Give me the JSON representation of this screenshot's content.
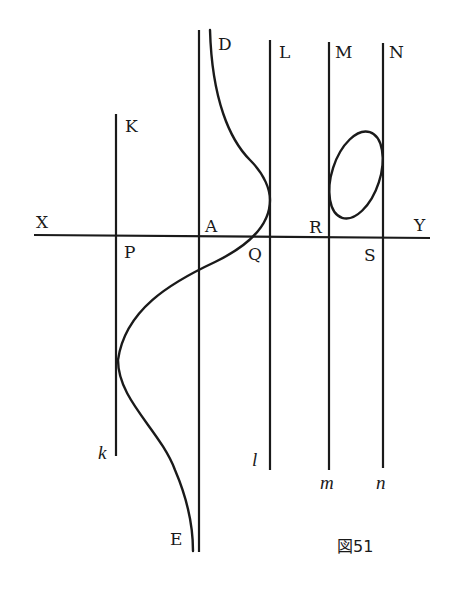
{
  "figure": {
    "caption": "図51",
    "labels": {
      "X": "X",
      "Y": "Y",
      "A": "A",
      "P": "P",
      "Q": "Q",
      "R": "R",
      "S": "S",
      "D": "D",
      "E": "E",
      "K": "K",
      "L": "L",
      "M": "M",
      "N": "N",
      "k": "k",
      "l": "l",
      "m": "m",
      "n": "n"
    }
  }
}
